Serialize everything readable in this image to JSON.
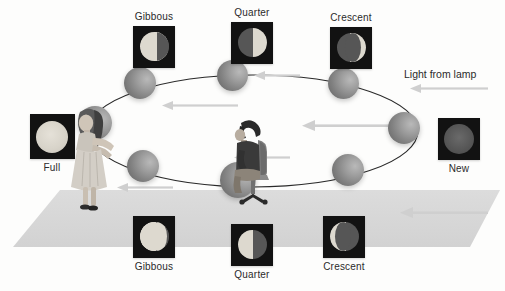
{
  "scene": {
    "title": "Moon phases demonstration with lamp, observer and orbiting ball",
    "background_color": "#fdfdfc",
    "ground_color": "#d9d9d9",
    "orbit_stroke": "#2a2a2a",
    "ball_color": "#8e8e8e",
    "tile_background": "#121212",
    "lit_color": "#ddd9cf",
    "dark_color": "#565656",
    "arrow_color": "#c9c9c9",
    "text_color": "#2b2b2b"
  },
  "annotations": {
    "light_from_lamp": "Light from lamp"
  },
  "phase_tiles": [
    {
      "id": "gibbous-top",
      "label": "Gibbous",
      "label_position": "above",
      "phase": "waning-gibbous-right"
    },
    {
      "id": "quarter-top",
      "label": "Quarter",
      "label_position": "above",
      "phase": "half-right-lit"
    },
    {
      "id": "crescent-top",
      "label": "Crescent",
      "label_position": "above",
      "phase": "crescent-right-lit"
    },
    {
      "id": "new",
      "label": "New",
      "label_position": "below",
      "phase": "new"
    },
    {
      "id": "crescent-bottom",
      "label": "Crescent",
      "label_position": "below",
      "phase": "crescent-left-lit"
    },
    {
      "id": "quarter-bottom",
      "label": "Quarter",
      "label_position": "below",
      "phase": "half-left-lit"
    },
    {
      "id": "gibbous-bottom",
      "label": "Gibbous",
      "label_position": "below",
      "phase": "waxing-gibbous-left"
    },
    {
      "id": "full",
      "label": "Full",
      "label_position": "below",
      "phase": "full"
    }
  ],
  "orbit_balls": [
    {
      "id": "ball-left",
      "x": 95,
      "y": 123
    },
    {
      "id": "ball-upper-left",
      "x": 140,
      "y": 83
    },
    {
      "id": "ball-top",
      "x": 232,
      "y": 75
    },
    {
      "id": "ball-upper-right",
      "x": 343,
      "y": 83
    },
    {
      "id": "ball-right",
      "x": 403,
      "y": 128
    },
    {
      "id": "ball-lower-right",
      "x": 348,
      "y": 170
    },
    {
      "id": "ball-bottom",
      "x": 238,
      "y": 180
    },
    {
      "id": "ball-lower-left",
      "x": 143,
      "y": 166
    }
  ],
  "figures": [
    {
      "id": "woman-holding-ball",
      "role": "person holding ball at full moon position"
    },
    {
      "id": "seated-observer",
      "role": "person seated on chair at center"
    }
  ],
  "light_arrows": [
    {
      "id": "arrow-lamp-label"
    },
    {
      "id": "arrow-upper-left"
    },
    {
      "id": "arrow-top"
    },
    {
      "id": "arrow-mid-right"
    },
    {
      "id": "arrow-center"
    },
    {
      "id": "arrow-lower-left"
    },
    {
      "id": "arrow-ground-right"
    }
  ]
}
